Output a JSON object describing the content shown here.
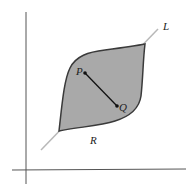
{
  "diagram": {
    "type": "convex-region-figure",
    "labels": {
      "line": "L",
      "point_p": "P",
      "point_q": "Q",
      "region": "R"
    },
    "colors": {
      "region_fill": "#a9a9a9",
      "region_stroke": "#3a3a3a",
      "line_l": "#b8b8b8",
      "segment": "#111111",
      "axes": "#555555"
    }
  }
}
